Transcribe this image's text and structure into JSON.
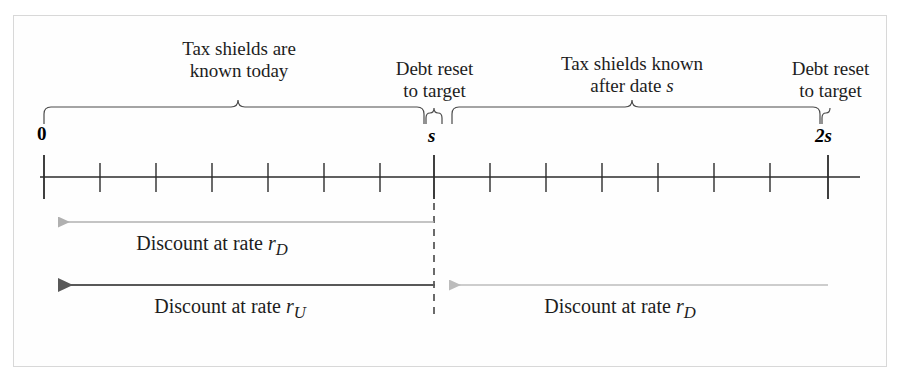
{
  "figure": {
    "frame_color": "#d8d8d8",
    "background": "#fefefe"
  },
  "timeline": {
    "axis_color": "#2b2b2b",
    "labels": [
      {
        "id": "t0",
        "text": "0",
        "italic": false,
        "x": 44
      },
      {
        "id": "ts",
        "text": "s",
        "italic": true,
        "x": 434
      },
      {
        "id": "t2s",
        "text": "2s",
        "italic": true,
        "x": 828
      }
    ],
    "major_ticks": [
      44,
      434,
      828
    ],
    "minor_ticks": [
      100,
      156,
      212,
      268,
      324,
      380,
      490,
      546,
      602,
      658,
      714,
      770
    ],
    "axis_start_x": 40,
    "axis_end_x": 860,
    "axis_y": 177
  },
  "braces": [
    {
      "id": "brace-known-today",
      "start_x": 44,
      "end_x": 424,
      "label_line1": "Tax shields are",
      "label_line2": "known today",
      "label_italic_tail": ""
    },
    {
      "id": "brace-reset-at-s",
      "start_x": 426,
      "end_x": 450,
      "label_line1": "Debt reset",
      "label_line2": "to target",
      "label_italic_tail": ""
    },
    {
      "id": "brace-known-after-s",
      "start_x": 452,
      "end_x": 820,
      "label_line1": "Tax shields known",
      "label_line2": "after date ",
      "label_italic_tail": "s"
    },
    {
      "id": "brace-reset-at-2s",
      "start_x": 820,
      "end_x": 844,
      "label_line1": "Debt reset",
      "label_line2": "to target",
      "label_italic_tail": ""
    }
  ],
  "discount_arrows": [
    {
      "id": "arrow-rd-first-period",
      "label_prefix": "Discount at rate ",
      "rate_symbol": "r",
      "rate_subscript": "D",
      "color": "#b0b0b0",
      "from_x": 434,
      "to_x": 46,
      "y": 222,
      "direction": "left",
      "label_x": 212,
      "label_y": 232
    },
    {
      "id": "arrow-ru-unlevered",
      "label_prefix": "Discount at rate ",
      "rate_symbol": "r",
      "rate_subscript": "U",
      "color": "#585858",
      "from_x": 435,
      "to_x": 44,
      "y": 285,
      "direction": "left",
      "label_x": 230,
      "label_y": 295
    },
    {
      "id": "arrow-rd-second-period",
      "label_prefix": "Discount at rate ",
      "rate_symbol": "r",
      "rate_subscript": "D",
      "color": "#b8b8b8",
      "from_x": 828,
      "to_x": 436,
      "y": 285,
      "direction": "left",
      "label_x": 620,
      "label_y": 295
    }
  ],
  "reset_divider": {
    "id": "dashed-divider-at-s",
    "x": 434,
    "y_top": 190,
    "y_bottom": 318,
    "color": "#3a3a3a",
    "dash": "7 6"
  }
}
